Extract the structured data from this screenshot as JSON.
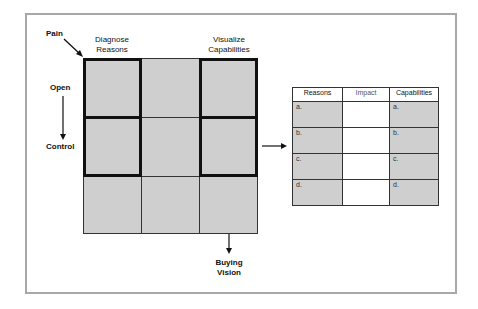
{
  "labels": {
    "pain": "Pain",
    "diagnose": "Diagnose",
    "reasons": "Reasons",
    "visualize": "Visualize",
    "capabilities": "Capabilities",
    "open": "Open",
    "control": "Control",
    "buying": "Buying",
    "vision": "Vision"
  },
  "grid": {
    "rows": 3,
    "cols": 3,
    "fill_color": "#cfcfcf",
    "highlighted_blocks": [
      "column-1-rows-1-2",
      "column-3-rows-1-2"
    ]
  },
  "table": {
    "headers": [
      "Reasons",
      "Impact",
      "Capabilities"
    ],
    "rows": [
      [
        "a.",
        "",
        "a."
      ],
      [
        "b.",
        "",
        "b."
      ],
      [
        "c.",
        "",
        "c."
      ],
      [
        "d.",
        "",
        "d."
      ]
    ]
  },
  "colors": {
    "frame": "#a8a8a8",
    "cell_fill": "#cfcfcf",
    "line": "#111111"
  }
}
